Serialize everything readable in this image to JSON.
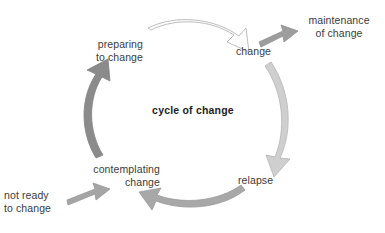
{
  "diagram": {
    "title": "cycle of change",
    "center_label": "cycle of change",
    "stages": [
      {
        "id": "preparing",
        "label": "preparing\nto change"
      },
      {
        "id": "change",
        "label": "change"
      },
      {
        "id": "relapse",
        "label": "relapse"
      },
      {
        "id": "contemplating",
        "label": "contemplating\nchange"
      }
    ],
    "entry_label": "not ready\nto change",
    "exit_label": "maintenance\nof change",
    "arrows": [
      {
        "id": "preparing-to-change",
        "from": "preparing",
        "to": "change",
        "style": "outline",
        "fill": "#fdfdfd",
        "stroke": "#b9b9b9"
      },
      {
        "id": "change-to-relapse",
        "from": "change",
        "to": "relapse",
        "style": "solid",
        "fill": "#cfcfcf",
        "stroke": "#b0b0b0"
      },
      {
        "id": "relapse-to-contemplating",
        "from": "relapse",
        "to": "contemplating",
        "style": "solid",
        "fill": "#a8a8a8",
        "stroke": "#9a9a9a"
      },
      {
        "id": "contemplating-to-preparing",
        "from": "contemplating",
        "to": "preparing",
        "style": "solid",
        "fill": "#8b8b8b",
        "stroke": "#808080"
      },
      {
        "id": "not-ready-to-contemplating",
        "from": "not ready to change",
        "to": "contemplating",
        "style": "solid",
        "fill": "#a5a5a5",
        "stroke": "#989898"
      },
      {
        "id": "change-to-maintenance",
        "from": "change",
        "to": "maintenance of change",
        "style": "solid",
        "fill": "#9d9d9d",
        "stroke": "#919191"
      }
    ],
    "colors": {
      "text": "#3b3b3b",
      "center_text": "#1d1d1d",
      "background": "#ffffff",
      "arrow_lightest": "#fdfdfd",
      "arrow_light": "#cfcfcf",
      "arrow_medium": "#a8a8a8",
      "arrow_dark": "#8b8b8b"
    }
  }
}
